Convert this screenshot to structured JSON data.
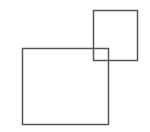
{
  "diagram": {
    "stroke_color": "#555555",
    "stroke_width": 1.5,
    "shapes": [
      {
        "id": "large-square",
        "x": 22,
        "y": 48,
        "width": 86,
        "height": 76
      },
      {
        "id": "small-square",
        "x": 93,
        "y": 10,
        "width": 44,
        "height": 50
      }
    ]
  }
}
